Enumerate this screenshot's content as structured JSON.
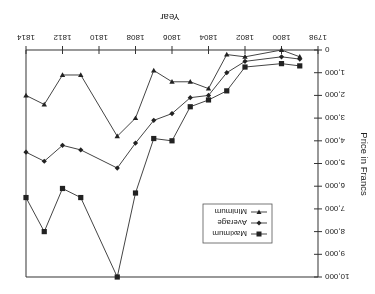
{
  "chart_data": {
    "type": "line",
    "title": "",
    "xlabel": "Year",
    "ylabel": "Price in Francs",
    "orientation_note": "rendered rotated 180 degrees",
    "xlim": [
      1798,
      1814
    ],
    "ylim": [
      0,
      10000
    ],
    "x_ticks": [
      "1798",
      "1800",
      "1802",
      "1804",
      "1806",
      "1808",
      "1810",
      "1812",
      "1814"
    ],
    "y_ticks": [
      "0",
      "1,000",
      "2,000",
      "3,000",
      "4,000",
      "5,000",
      "6,000",
      "7,000",
      "8,000",
      "9,000",
      "10,000"
    ],
    "grid": false,
    "legend_position": "inside upper-middle",
    "x": [
      1799,
      1800,
      1802,
      1803,
      1804,
      1805,
      1806,
      1807,
      1808,
      1809,
      1811,
      1812,
      1813,
      1814
    ],
    "series": [
      {
        "name": "Maximum",
        "marker": "square",
        "values": [
          700,
          600,
          750,
          1800,
          2200,
          2500,
          4000,
          3900,
          6300,
          10000,
          6500,
          6100,
          8000,
          6500
        ]
      },
      {
        "name": "Average",
        "marker": "diamond",
        "values": [
          400,
          300,
          500,
          1000,
          2000,
          2100,
          2800,
          3100,
          4100,
          5200,
          4400,
          4200,
          4900,
          4500
        ]
      },
      {
        "name": "Minimum",
        "marker": "triangle-down",
        "values": [
          300,
          0,
          300,
          200,
          1700,
          1400,
          1400,
          900,
          3000,
          3800,
          1100,
          1100,
          2400,
          2000
        ]
      }
    ]
  },
  "legend": {
    "items": [
      {
        "label": "Maximum"
      },
      {
        "label": "Average"
      },
      {
        "label": "Minimum"
      }
    ]
  },
  "axes": {
    "x_title": "Year",
    "y_title": "Price in Francs"
  }
}
